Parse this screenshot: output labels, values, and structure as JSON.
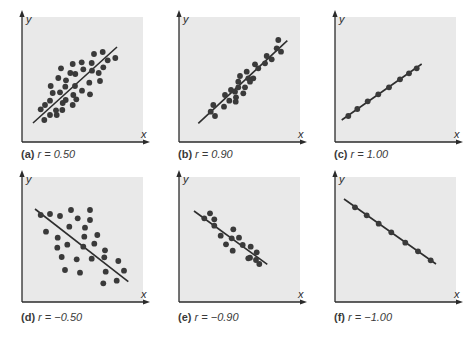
{
  "figure": {
    "colors": {
      "background": "#ffffff",
      "plot_area": "#e9e9e9",
      "axis": "#2b2b2b",
      "dot": "#3a3a3a",
      "line": "#2e2e2e",
      "label_text": "#3a3a3a"
    }
  },
  "panels": [
    {
      "tag": "(a)",
      "equation": "r = 0.50"
    },
    {
      "tag": "(b)",
      "equation": "r = 0.90"
    },
    {
      "tag": "(c)",
      "equation": "r = 1.00"
    },
    {
      "tag": "(d)",
      "equation": "r = −0.50"
    },
    {
      "tag": "(e)",
      "equation": "r = −0.90"
    },
    {
      "tag": "(f)",
      "equation": "r = −1.00"
    }
  ],
  "axis_labels": {
    "x": "x",
    "y": "y"
  },
  "chart_data": [
    {
      "type": "scatter",
      "title": "(a) r = 0.50",
      "r": 0.5,
      "xlabel": "x",
      "ylabel": "y",
      "grid": false,
      "regression_line": true,
      "origin": [
        22,
        142
      ],
      "line": [
        [
          33,
          123
        ],
        [
          117,
          47
        ]
      ],
      "points": [
        [
          40.7,
          109.3
        ],
        [
          45,
          105
        ],
        [
          44.3,
          120
        ],
        [
          50,
          115
        ],
        [
          56,
          110.3
        ],
        [
          56.7,
          115
        ],
        [
          62.3,
          110
        ],
        [
          50,
          100.7
        ],
        [
          52.7,
          93
        ],
        [
          60,
          92.3
        ],
        [
          50.7,
          86
        ],
        [
          62.7,
          103
        ],
        [
          65.7,
          100
        ],
        [
          65.3,
          86.7
        ],
        [
          66,
          80.3
        ],
        [
          58.3,
          78
        ],
        [
          61,
          68.3
        ],
        [
          70.3,
          73
        ],
        [
          75.3,
          74
        ],
        [
          72.7,
          64
        ],
        [
          75,
          86
        ],
        [
          73.3,
          95
        ],
        [
          76.3,
          99.3
        ],
        [
          72.7,
          105
        ],
        [
          81.7,
          62.3
        ],
        [
          83.3,
          69.3
        ],
        [
          82,
          90.7
        ],
        [
          89.3,
          82.7
        ],
        [
          90,
          94.3
        ],
        [
          92,
          70.7
        ],
        [
          91.7,
          63
        ],
        [
          94,
          54
        ],
        [
          98.7,
          73
        ],
        [
          100,
          81
        ],
        [
          102.7,
          52
        ],
        [
          103.3,
          67.3
        ],
        [
          107.7,
          60.3
        ],
        [
          115.3,
          58
        ]
      ]
    },
    {
      "type": "scatter",
      "title": "(b) r = 0.90",
      "r": 0.9,
      "xlabel": "x",
      "ylabel": "y",
      "grid": false,
      "regression_line": true,
      "origin": [
        179,
        142
      ],
      "line": [
        [
          198.3,
          123.3
        ],
        [
          287.3,
          40.7
        ]
      ],
      "points": [
        [
          210.7,
          111.7
        ],
        [
          215,
          116
        ],
        [
          213.3,
          105
        ],
        [
          224,
          106.7
        ],
        [
          225,
          95
        ],
        [
          229.3,
          100.7
        ],
        [
          231,
          90
        ],
        [
          235,
          91.7
        ],
        [
          236,
          97.3
        ],
        [
          235.7,
          101.7
        ],
        [
          238.3,
          87.3
        ],
        [
          240,
          76
        ],
        [
          238.3,
          81.7
        ],
        [
          245,
          87.3
        ],
        [
          243.3,
          93.3
        ],
        [
          246.7,
          71.7
        ],
        [
          248.3,
          78.3
        ],
        [
          253.3,
          78.3
        ],
        [
          255,
          64.3
        ],
        [
          258.3,
          68.3
        ],
        [
          265,
          63.3
        ],
        [
          266.7,
          56
        ],
        [
          271.7,
          59.3
        ],
        [
          276.7,
          48.3
        ],
        [
          278.3,
          40
        ],
        [
          281,
          51.7
        ],
        [
          250,
          81.7
        ]
      ]
    },
    {
      "type": "scatter",
      "title": "(c) r = 1.00",
      "r": 1.0,
      "xlabel": "x",
      "ylabel": "y",
      "grid": false,
      "regression_line": true,
      "origin": [
        335,
        142
      ],
      "line": [
        [
          341.7,
          120
        ],
        [
          421.7,
          64
        ]
      ],
      "points": [
        [
          348.3,
          116
        ],
        [
          357.3,
          109
        ],
        [
          367.7,
          101.3
        ],
        [
          378.3,
          94.3
        ],
        [
          389,
          87.3
        ],
        [
          400,
          79.3
        ],
        [
          409,
          73.3
        ],
        [
          416.7,
          68.3
        ]
      ]
    },
    {
      "type": "scatter",
      "title": "(d) r = −0.50",
      "r": -0.5,
      "xlabel": "x",
      "ylabel": "y",
      "grid": false,
      "regression_line": true,
      "origin": [
        22,
        302
      ],
      "line": [
        [
          35,
          209
        ],
        [
          128.3,
          281.7
        ]
      ],
      "points": [
        [
          40.7,
          215
        ],
        [
          50,
          214
        ],
        [
          60,
          216
        ],
        [
          71,
          210
        ],
        [
          90,
          210
        ],
        [
          77.7,
          218.3
        ],
        [
          90,
          220
        ],
        [
          46,
          231.7
        ],
        [
          69.3,
          226.7
        ],
        [
          85,
          227.7
        ],
        [
          97.3,
          235
        ],
        [
          57.7,
          237.7
        ],
        [
          84.3,
          236.7
        ],
        [
          94.3,
          243.7
        ],
        [
          57.3,
          247.7
        ],
        [
          67.3,
          244.7
        ],
        [
          83.3,
          246.7
        ],
        [
          105,
          250.3
        ],
        [
          61.7,
          257
        ],
        [
          76.7,
          259.3
        ],
        [
          91.7,
          258.7
        ],
        [
          104.3,
          257.3
        ],
        [
          118.3,
          261
        ],
        [
          65,
          270
        ],
        [
          80,
          272.7
        ],
        [
          105.7,
          271.7
        ],
        [
          124,
          270.7
        ],
        [
          103.3,
          283.3
        ],
        [
          116.7,
          280.7
        ]
      ]
    },
    {
      "type": "scatter",
      "title": "(e) r = −0.90",
      "r": -0.9,
      "xlabel": "x",
      "ylabel": "y",
      "grid": false,
      "regression_line": true,
      "origin": [
        179,
        302
      ],
      "line": [
        [
          194,
          211
        ],
        [
          267.3,
          264.3
        ]
      ],
      "points": [
        [
          204.3,
          218.3
        ],
        [
          210,
          213.3
        ],
        [
          214.3,
          219.3
        ],
        [
          214.3,
          225.7
        ],
        [
          220.7,
          235.7
        ],
        [
          226,
          244.3
        ],
        [
          233.3,
          229.3
        ],
        [
          231.7,
          238.3
        ],
        [
          239,
          237.7
        ],
        [
          232.7,
          250.7
        ],
        [
          242.7,
          245
        ],
        [
          250.7,
          246.7
        ],
        [
          256.7,
          252.3
        ],
        [
          250,
          257.7
        ],
        [
          256,
          260
        ],
        [
          248.3,
          258.3
        ],
        [
          259.3,
          264
        ]
      ]
    },
    {
      "type": "scatter",
      "title": "(f) r = −1.00",
      "r": -1.0,
      "xlabel": "x",
      "ylabel": "y",
      "grid": false,
      "regression_line": true,
      "origin": [
        335,
        302
      ],
      "line": [
        [
          344,
          199
        ],
        [
          436,
          264
        ]
      ],
      "points": [
        [
          355,
          207.3
        ],
        [
          366.7,
          215.3
        ],
        [
          378.7,
          223.7
        ],
        [
          391.3,
          232.3
        ],
        [
          405.3,
          242.7
        ],
        [
          418,
          251.3
        ],
        [
          430.7,
          260.3
        ]
      ]
    }
  ]
}
